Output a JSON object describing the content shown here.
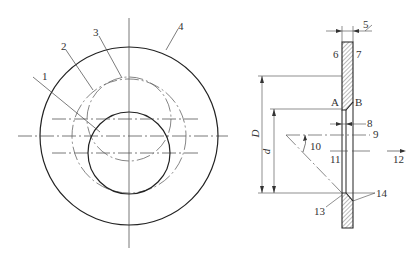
{
  "diagram": {
    "type": "engineering-drawing",
    "views": [
      "front-view",
      "section-view"
    ],
    "colors": {
      "line": "#222222",
      "center_line": "#555555",
      "hatch": "#555555",
      "background": "#ffffff"
    }
  },
  "front_view": {
    "labels": [
      {
        "id": "1",
        "text": "1"
      },
      {
        "id": "2",
        "text": "2"
      },
      {
        "id": "3",
        "text": "3"
      },
      {
        "id": "4",
        "text": "4"
      }
    ]
  },
  "section_view": {
    "labels": [
      {
        "id": "5",
        "text": "5"
      },
      {
        "id": "6",
        "text": "6"
      },
      {
        "id": "7",
        "text": "7"
      },
      {
        "id": "A",
        "text": "A"
      },
      {
        "id": "B",
        "text": "B"
      },
      {
        "id": "8",
        "text": "8"
      },
      {
        "id": "9",
        "text": "9"
      },
      {
        "id": "10",
        "text": "10"
      },
      {
        "id": "11",
        "text": "11"
      },
      {
        "id": "12",
        "text": "12"
      },
      {
        "id": "13",
        "text": "13"
      },
      {
        "id": "14",
        "text": "14"
      }
    ],
    "dimensions": [
      {
        "id": "D",
        "text": "D"
      },
      {
        "id": "d",
        "text": "d"
      }
    ]
  }
}
